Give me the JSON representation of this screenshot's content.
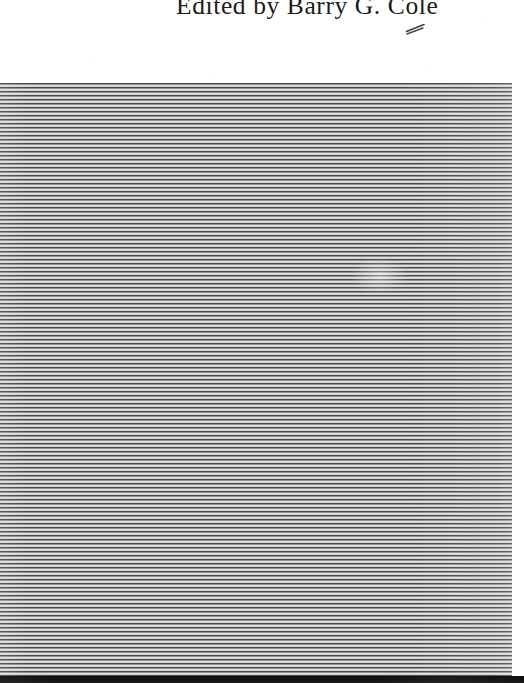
{
  "document": {
    "kind": "scanned-book-page",
    "credit_line": "Edited by Barry G. Cole",
    "annotation_mark": "handwritten-pencil-tick",
    "blemish": "pale-scan-smudge"
  },
  "colors": {
    "paper": "#ffffff",
    "rib_dark": "#3a3a3a",
    "rib_light": "#eeeeee",
    "board_base": "#b9b9b9",
    "bottom_shadow": "#0d0d0d",
    "text": "#1b1b1b"
  },
  "regions": {
    "top_paper": {
      "label": "white paper margin",
      "x": 0,
      "y": 0,
      "width": 524,
      "height": 83
    },
    "ribbed_board": {
      "label": "horizontally ribbed board",
      "x": 0,
      "y": 83,
      "width": 512,
      "height": 593,
      "stripe_period_px": 4
    },
    "right_margin": {
      "label": "white paper right margin",
      "x": 512,
      "y": 83,
      "width": 12,
      "height": 600
    },
    "bottom_shadow": {
      "label": "dark edge shadow",
      "x": 0,
      "y": 676,
      "width": 524,
      "height": 7
    }
  }
}
